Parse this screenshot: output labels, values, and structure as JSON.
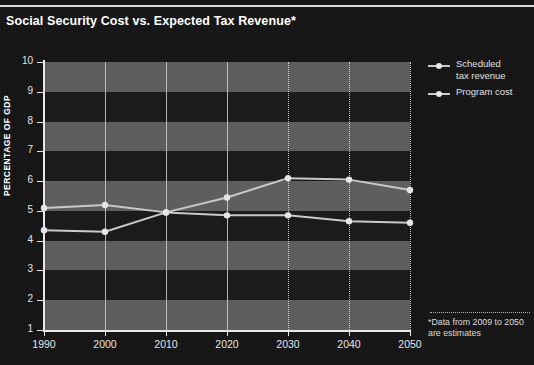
{
  "figure": {
    "title": "Social Security Cost vs. Expected Tax Revenue*",
    "background_color": "#151515",
    "band_light_color": "#5e5e5e",
    "band_dark_color": "#1b1b1b",
    "axis_color": "#e8e8e8",
    "series_color": "#c9c9c9"
  },
  "legend": {
    "position": "right",
    "items": [
      {
        "label_line1": "Scheduled",
        "label_line2": "tax revenue",
        "marker": "line-with-dot"
      },
      {
        "label_line1": "Program cost",
        "label_line2": "",
        "marker": "line-with-dot"
      }
    ]
  },
  "footnote": {
    "line1": "*Data from 2009 to 2050",
    "line2": "are estimates"
  },
  "chart_data": {
    "type": "line",
    "title": "Social Security Cost vs. Expected Tax Revenue*",
    "xlabel": "",
    "ylabel": "PERCENTAGE OF GDP",
    "x": [
      1990,
      2000,
      2010,
      2020,
      2030,
      2040,
      2050
    ],
    "xticklabels": [
      "1990",
      "2000",
      "2010",
      "2020",
      "2030",
      "2040",
      "2050"
    ],
    "yticklabels": [
      "1",
      "2",
      "3",
      "4",
      "5",
      "6",
      "7",
      "8",
      "9",
      "10"
    ],
    "ylim": [
      1,
      10
    ],
    "xlim": [
      1990,
      2050
    ],
    "grid": "vertical-gridlines-and-alternating-horizontal-bands",
    "legend_position": "right",
    "annotations": [
      "*Data from 2009 to 2050 are estimates"
    ],
    "series": [
      {
        "name": "Scheduled tax revenue",
        "values": [
          4.35,
          4.3,
          4.95,
          4.85,
          4.85,
          4.65,
          4.6
        ]
      },
      {
        "name": "Program cost",
        "values": [
          5.1,
          5.2,
          4.95,
          5.45,
          6.1,
          6.05,
          5.7
        ]
      }
    ]
  }
}
